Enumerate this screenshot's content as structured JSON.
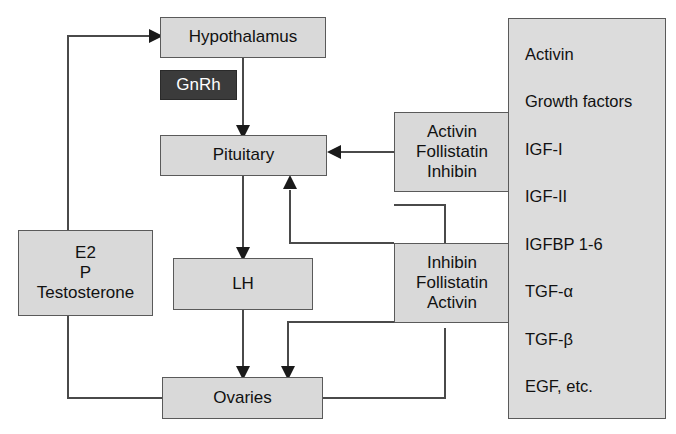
{
  "diagram": {
    "title_hidden": "",
    "nodes": {
      "hypothalamus": {
        "label": "Hypothalamus"
      },
      "gnrh": {
        "label": "GnRh"
      },
      "pituitary": {
        "label": "Pituitary"
      },
      "lh": {
        "label": "LH"
      },
      "ovaries": {
        "label": "Ovaries"
      },
      "steroids": {
        "lines": [
          "E2",
          "P",
          "Testosterone"
        ]
      },
      "pituitary_regulators": {
        "lines": [
          "Activin",
          "Follistatin",
          "Inhibin"
        ]
      },
      "ovarian_regulators": {
        "lines": [
          "Inhibin",
          "Follistatin",
          "Activin"
        ]
      }
    },
    "growth_factor_panel": {
      "items": [
        "Activin",
        "Growth factors",
        "IGF-I",
        "IGF-II",
        "IGFBP 1-6",
        "TGF-α",
        "TGF-β",
        "EGF, etc."
      ]
    },
    "colors": {
      "node_fill": "#d9d9d9",
      "panel_fill": "#dcdcdc",
      "dark_fill": "#3b3b3b",
      "border": "#5a5a5a",
      "wire": "#4a4a4a",
      "text": "#111111",
      "dark_text": "#ffffff"
    },
    "edges": [
      {
        "from": "hypothalamus",
        "to": "pituitary",
        "arrow": true
      },
      {
        "from": "pituitary",
        "to": "lh",
        "arrow": true
      },
      {
        "from": "lh",
        "to": "ovaries",
        "arrow": true
      },
      {
        "from": "pituitary_regulators",
        "to": "pituitary",
        "arrow": true
      },
      {
        "from": "ovarian_regulators",
        "to": "pituitary",
        "arrow": true
      },
      {
        "from": "ovarian_regulators",
        "to": "ovaries",
        "arrow": true
      },
      {
        "from": "ovaries",
        "to": "ovarian_regulators",
        "arrow": false
      },
      {
        "from": "ovaries",
        "to": "steroids",
        "arrow": false
      },
      {
        "from": "steroids",
        "to": "hypothalamus",
        "arrow": true
      }
    ]
  }
}
